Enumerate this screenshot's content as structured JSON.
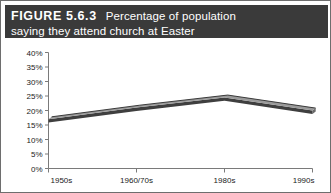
{
  "figure": {
    "label": "FIGURE 5.6.3",
    "caption_line1": "Percentage of population",
    "caption_line2": "saying they attend church at Easter",
    "header_bg": "#3a3a3a",
    "header_fg": "#ffffff",
    "border_color": "#6e6e6e"
  },
  "chart_data": {
    "type": "line",
    "title": "Percentage of population saying they attend church at Easter",
    "xlabel": "",
    "ylabel": "",
    "categories": [
      "1950s",
      "1960/70s",
      "1980s",
      "1990s"
    ],
    "values": [
      17,
      21,
      24.5,
      20
    ],
    "series": [
      {
        "name": "Percentage attending church at Easter",
        "values": [
          17,
          21,
          24.5,
          20
        ]
      }
    ],
    "ylim": [
      0,
      40
    ],
    "ytick_labels": [
      "0%",
      "5%",
      "10%",
      "15%",
      "20%",
      "25%",
      "30%",
      "35%",
      "40%"
    ],
    "ytick_values": [
      0,
      5,
      10,
      15,
      20,
      25,
      30,
      35,
      40
    ],
    "grid": false,
    "legend": false,
    "line_style": "3d-ribbon",
    "line_color_top": "#9a9a9a",
    "line_color_face": "#3f3f3f",
    "line_color_side": "#6a6a6a",
    "axis_color": "#7a7a7a"
  }
}
